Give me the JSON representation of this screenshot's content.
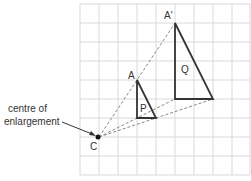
{
  "diagram": {
    "grid": {
      "columns": 9,
      "rows": 9,
      "color": "#d9d9d9"
    },
    "centre": {
      "label": "C",
      "annotation_line1": "centre of",
      "annotation_line2": "enlargement"
    },
    "triangle_p": {
      "label": "P",
      "vertex_label": "A"
    },
    "triangle_q": {
      "label": "Q",
      "vertex_label": "A'"
    },
    "colors": {
      "shape_stroke": "#333333",
      "dashed": "#888888",
      "text": "#333333"
    }
  }
}
